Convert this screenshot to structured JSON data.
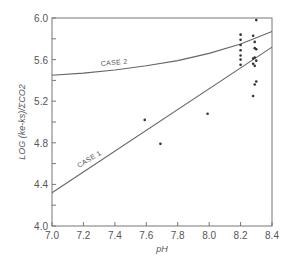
{
  "chart_data": {
    "type": "scatter",
    "title": "",
    "xlabel": "pH",
    "ylabel": "LOG (ke-ks)/ΣCO2",
    "xlim": [
      7.0,
      8.4
    ],
    "ylim": [
      4.0,
      6.0
    ],
    "x_ticks": [
      "7.0",
      "7.2",
      "7.4",
      "7.6",
      "7.8",
      "8.0",
      "8.2",
      "8.4"
    ],
    "y_ticks": [
      "4.0",
      "4.4",
      "4.8",
      "5.2",
      "5.6",
      "6.0"
    ],
    "grid": false,
    "series": [
      {
        "name": "CASE 1",
        "kind": "line",
        "x": [
          7.0,
          8.4
        ],
        "y": [
          4.32,
          5.72
        ]
      },
      {
        "name": "CASE 2",
        "kind": "curve",
        "x": [
          7.0,
          7.2,
          7.4,
          7.6,
          7.8,
          8.0,
          8.2,
          8.4
        ],
        "y": [
          5.45,
          5.47,
          5.5,
          5.54,
          5.59,
          5.66,
          5.75,
          5.87
        ]
      },
      {
        "name": "observations",
        "kind": "points",
        "x": [
          7.59,
          7.69,
          7.99,
          8.2,
          8.2,
          8.2,
          8.2,
          8.2,
          8.2,
          8.2,
          8.3,
          8.28,
          8.29,
          8.29,
          8.3,
          8.29,
          8.28,
          8.3,
          8.28,
          8.3,
          8.29,
          8.28,
          8.29
        ],
        "y": [
          5.02,
          4.79,
          5.08,
          5.84,
          5.79,
          5.74,
          5.69,
          5.64,
          5.6,
          5.55,
          5.98,
          5.83,
          5.77,
          5.71,
          5.7,
          5.62,
          5.61,
          5.59,
          5.56,
          5.39,
          5.36,
          5.25,
          5.54
        ]
      }
    ],
    "annotations": [
      "CASE 1",
      "CASE 2"
    ]
  }
}
